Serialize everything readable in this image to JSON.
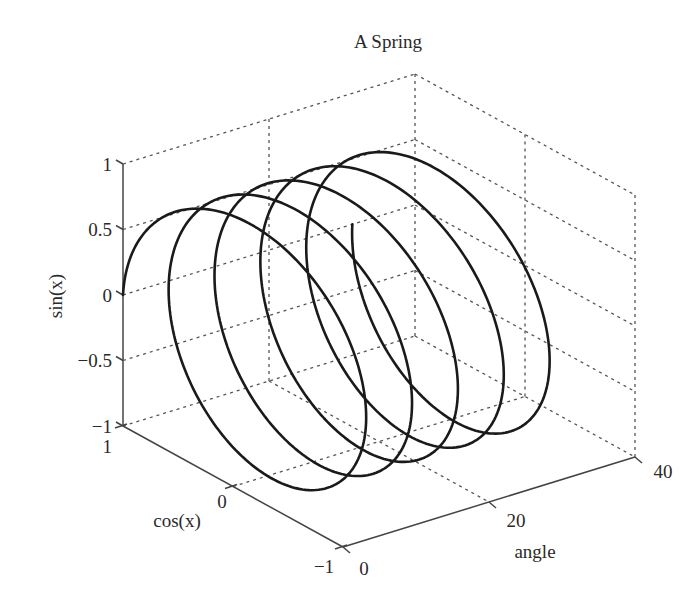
{
  "chart_data": {
    "type": "line3d",
    "title": "A Spring",
    "xlabel": "angle",
    "ylabel": "cos(x)",
    "zlabel": "sin(x)",
    "xlim": [
      0,
      40
    ],
    "ylim": [
      -1,
      1
    ],
    "zlim": [
      -1,
      1
    ],
    "x_ticks": [
      "0",
      "20",
      "40"
    ],
    "y_ticks": [
      "1",
      "0",
      "−1"
    ],
    "z_ticks": [
      "1",
      "0.5",
      "0",
      "−0.5",
      "−1"
    ],
    "grid": true,
    "series": [
      {
        "name": "spring",
        "x": "t, t from 0 to 10π (≈31.4)",
        "y": "cos(t)",
        "z": "sin(t)",
        "t_start": 0,
        "t_end": 31.4159,
        "loops": 5,
        "color": "#1a1a1a"
      }
    ]
  },
  "projection": {
    "origin_cos1_sin0_angle0": [
      123,
      295
    ],
    "angle_full_vec": [
      292,
      -90
    ],
    "cos_unit_vec": [
      110,
      60.5
    ],
    "sin_unit_px": 131
  },
  "labels": {
    "title": "A Spring",
    "zlabel": "sin(x)",
    "ylabel": "cos(x)",
    "xlabel": "angle",
    "z_tick_1": "1",
    "z_tick_05": "0.5",
    "z_tick_0": "0",
    "z_tick_m05": "−0.5",
    "z_tick_m1": "−1",
    "y_tick_1": "1",
    "y_tick_0": "0",
    "y_tick_m1": "−1",
    "x_tick_0": "0",
    "x_tick_20": "20",
    "x_tick_40": "40"
  }
}
